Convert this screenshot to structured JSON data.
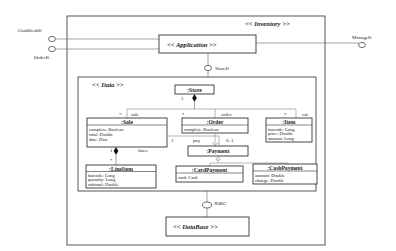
{
  "diagram": {
    "inventory": {
      "label": "<< Inventory >>"
    },
    "application": {
      "label": "<< Application >>"
    },
    "data": {
      "label": "<< Data >>"
    },
    "database": {
      "label": "<< DataBase >>"
    },
    "interfaces": {
      "cashdesk": "CashDeskIf",
      "order": "OrderIf",
      "manage": "ManageIf",
      "store": "StoreIf",
      "jdbc": "JDBC"
    },
    "classes": {
      "store": {
        "name": ":Store"
      },
      "sale": {
        "name": ":Sale",
        "attrs": [
          "complete: Boolean",
          "total: Double",
          "date: Date"
        ]
      },
      "order": {
        "name": ":Order",
        "attrs": [
          "complete: Boolean"
        ]
      },
      "item": {
        "name": ":Item",
        "attrs": [
          "barcode: Long",
          "price: Double",
          "amount: Long"
        ]
      },
      "payment": {
        "name": ":Payment"
      },
      "lineitem": {
        "name": ":LineItem",
        "attrs": [
          "barcode: Long",
          "quantity: Long",
          "subtotal: Double"
        ]
      },
      "cardpayment": {
        "name": ":CardPayment",
        "attrs": [
          "card: Card"
        ]
      },
      "cashpayment": {
        "name": ":CashPayment",
        "attrs": [
          "amount: Double",
          "change: Double"
        ]
      }
    },
    "associations": {
      "store_mult": "1",
      "sale_role": "sale",
      "sale_mult": "*",
      "order_role": "order",
      "order_mult": "*",
      "item_role": "cat",
      "item_mult": "*",
      "sale_lines_mult_top": "1",
      "lines_mult": "*",
      "lines_role": "lines",
      "pay_sale_mult": "1",
      "pay_role": "pay",
      "pay_mult": "0..1"
    }
  }
}
